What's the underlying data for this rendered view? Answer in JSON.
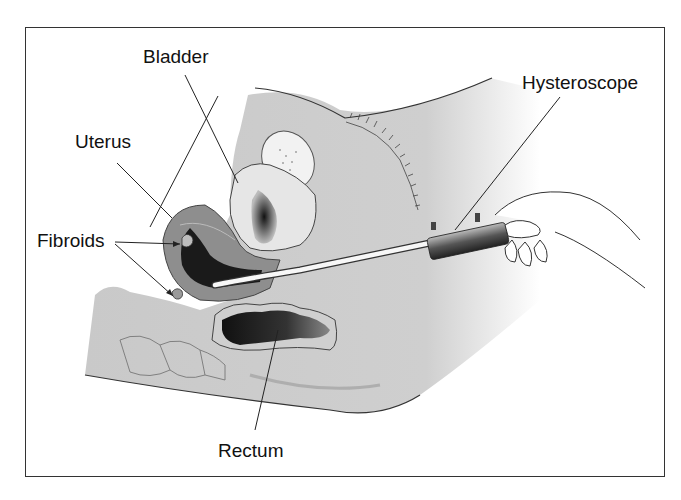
{
  "figure": {
    "labels": {
      "bladder": "Bladder",
      "uterus": "Uterus",
      "fibroids": "Fibroids",
      "hysteroscope": "Hysteroscope",
      "rectum": "Rectum"
    },
    "colors": {
      "tissue": "#c8c8c8",
      "tissue_dark": "#9a9a9a",
      "uterus": "#8e8e8e",
      "cavity": "#1a1a1a",
      "outline": "#333333",
      "background": "#ffffff"
    }
  }
}
